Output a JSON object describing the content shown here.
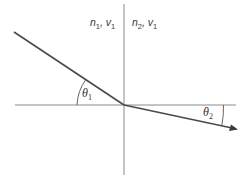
{
  "diagram": {
    "type": "refraction",
    "labels": {
      "medium1": {
        "n": "n",
        "n_sub": "1",
        "v": "v",
        "v_sub": "1"
      },
      "medium2": {
        "n": "n",
        "n_sub": "2",
        "v": "v",
        "v_sub": "1"
      },
      "angle1": {
        "symbol": "θ",
        "sub": "1"
      },
      "angle2": {
        "symbol": "θ",
        "sub": "2"
      }
    },
    "colors": {
      "line": "#4a4a4a",
      "axis": "#8a8a8a"
    }
  }
}
